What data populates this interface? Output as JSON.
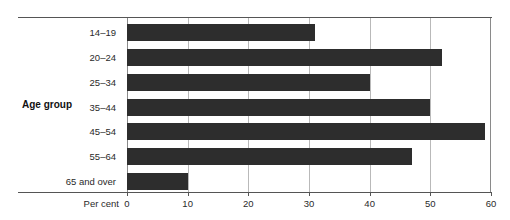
{
  "chart_data": {
    "type": "bar",
    "orientation": "horizontal",
    "title": "",
    "subtitle": "",
    "xlabel": "Per cent",
    "ylabel": "Age group",
    "categories": [
      "14–19",
      "20–24",
      "25–34",
      "35–44",
      "45–54",
      "55–64",
      "65 and over"
    ],
    "values": [
      31,
      52,
      40,
      50,
      59,
      47,
      10
    ],
    "series": [
      {
        "name": "Per cent",
        "values": [
          31,
          52,
          40,
          50,
          59,
          47,
          10
        ]
      }
    ],
    "xlim": [
      0,
      60
    ],
    "ylim": null,
    "xticks": [
      0,
      10,
      20,
      30,
      40,
      50,
      60
    ],
    "xtick_labels": [
      "0",
      "10",
      "20",
      "30",
      "40",
      "50",
      "60"
    ],
    "grid": true,
    "grid_axis": "x",
    "legend": false,
    "legend_position": "none",
    "annotations": [],
    "bar_color": "#2d2d2d",
    "gridline_color": "#b9b9b9",
    "axis_color": "#555555",
    "background_color": "#ffffff",
    "text_color": "#2a2a2a"
  }
}
